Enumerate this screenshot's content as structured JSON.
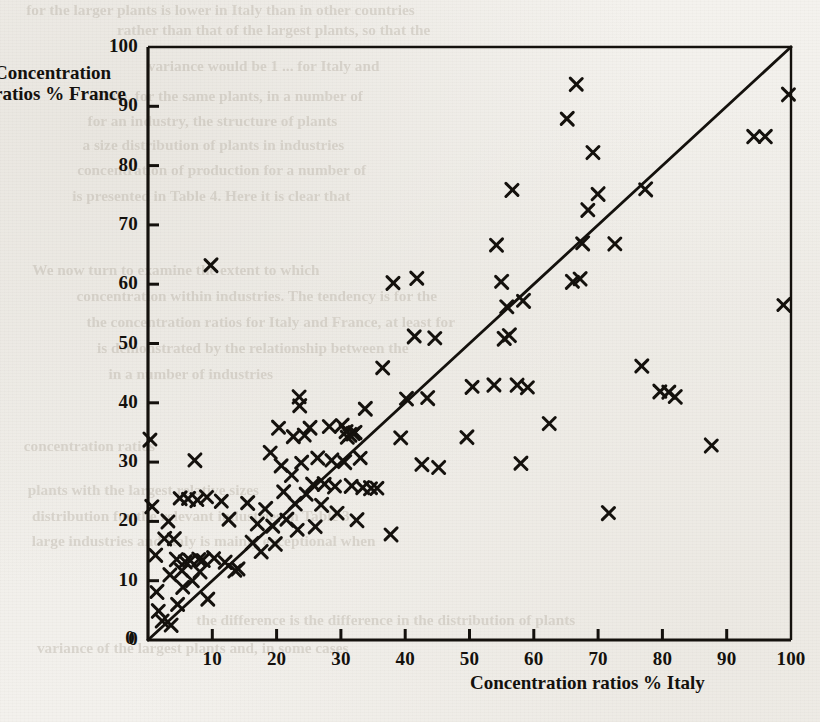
{
  "figure": {
    "kind": "scatter-plot",
    "page_background": "#f2f0ec",
    "ink_color": "#14110d"
  },
  "axes": {
    "y_title_line1": "Concentration",
    "y_title_line2": "ratios % France",
    "x_title": "Concentration ratios % Italy",
    "y_ticks": [
      "0",
      "10",
      "20",
      "30",
      "40",
      "50",
      "60",
      "70",
      "80",
      "90",
      "100"
    ],
    "x_ticks": [
      "0",
      "10",
      "20",
      "30",
      "40",
      "50",
      "60",
      "70",
      "80",
      "90",
      "100"
    ]
  },
  "ghost_text": [
    {
      "t": "for the larger plants is lower in Italy than in other countries",
      "x": 30,
      "y": 2,
      "size": 15
    },
    {
      "t": "rather than that of the largest plants, so that the",
      "x": 120,
      "y": 22,
      "size": 15
    },
    {
      "t": "variance would be 1 ... for Italy and",
      "x": 150,
      "y": 58,
      "size": 15
    },
    {
      "t": "while, for the same plants, in a number of",
      "x": 95,
      "y": 88,
      "size": 15
    },
    {
      "t": "for an industry, the structure of plants",
      "x": 90,
      "y": 113,
      "size": 15
    },
    {
      "t": "a size distribution of plants in industries",
      "x": 85,
      "y": 137,
      "size": 15
    },
    {
      "t": "concentration of production for a number of",
      "x": 80,
      "y": 162,
      "size": 15
    },
    {
      "t": "is presented in Table 4. Here it is clear that",
      "x": 75,
      "y": 188,
      "size": 15
    },
    {
      "t": "We now turn to examine the extent to which",
      "x": 35,
      "y": 262,
      "size": 15
    },
    {
      "t": "concentration within industries. The tendency is for the",
      "x": 80,
      "y": 288,
      "size": 15
    },
    {
      "t": "the concentration ratios for Italy and France, at least for",
      "x": 90,
      "y": 314,
      "size": 15
    },
    {
      "t": "is demonstrated by the relationship between the",
      "x": 100,
      "y": 340,
      "size": 15
    },
    {
      "t": "in a number of industries",
      "x": 110,
      "y": 366,
      "size": 15
    },
    {
      "t": "concentration ratios",
      "x": 25,
      "y": 438,
      "size": 15
    },
    {
      "t": "plants with the largest relative sizes",
      "x": 30,
      "y": 482,
      "size": 15
    },
    {
      "t": "distribution for the relevant industries in Table 3",
      "x": 35,
      "y": 508,
      "size": 15
    },
    {
      "t": "large industries and Italy is mainly exceptional when",
      "x": 35,
      "y": 533,
      "size": 15
    },
    {
      "t": "the difference is the difference in the distribution of plants",
      "x": 200,
      "y": 612,
      "size": 15
    },
    {
      "t": "variance of the largest plants and, in some cases",
      "x": 40,
      "y": 640,
      "size": 15
    }
  ],
  "chart_data": {
    "type": "scatter",
    "title": "",
    "xlabel": "Concentration ratios % Italy",
    "ylabel": "Concentration ratios % France",
    "xlim": [
      0,
      100
    ],
    "ylim": [
      0,
      100
    ],
    "grid": false,
    "legend": false,
    "marker": "x",
    "reference_line": {
      "kind": "identity",
      "from": [
        0,
        0
      ],
      "to": [
        100,
        100
      ],
      "label": "45-degree line"
    },
    "series": [
      {
        "name": "Industries",
        "points": [
          [
            0.3,
            33.8
          ],
          [
            0.6,
            22.5
          ],
          [
            1.2,
            14.3
          ],
          [
            1.4,
            8.1
          ],
          [
            1.6,
            4.9
          ],
          [
            2.2,
            3.2
          ],
          [
            2.6,
            17.1
          ],
          [
            3.1,
            20.0
          ],
          [
            3.4,
            11.0
          ],
          [
            3.6,
            2.5
          ],
          [
            4.1,
            17.0
          ],
          [
            4.4,
            13.6
          ],
          [
            4.6,
            6.0
          ],
          [
            5.0,
            23.9
          ],
          [
            5.2,
            11.7
          ],
          [
            5.4,
            8.9
          ],
          [
            5.8,
            13.2
          ],
          [
            6.3,
            23.8
          ],
          [
            6.5,
            13.4
          ],
          [
            6.9,
            10.0
          ],
          [
            7.3,
            30.3
          ],
          [
            7.6,
            23.6
          ],
          [
            7.9,
            13.6
          ],
          [
            8.1,
            11.5
          ],
          [
            8.6,
            13.5
          ],
          [
            9.1,
            24.1
          ],
          [
            9.3,
            6.9
          ],
          [
            9.8,
            63.2
          ],
          [
            10.2,
            13.8
          ],
          [
            11.4,
            23.4
          ],
          [
            12.0,
            13.1
          ],
          [
            12.6,
            20.3
          ],
          [
            13.5,
            11.7
          ],
          [
            14.0,
            12.0
          ],
          [
            15.5,
            23.1
          ],
          [
            16.2,
            16.4
          ],
          [
            17.0,
            19.6
          ],
          [
            17.6,
            14.9
          ],
          [
            18.3,
            22.1
          ],
          [
            19.0,
            31.6
          ],
          [
            19.4,
            19.2
          ],
          [
            19.8,
            16.2
          ],
          [
            20.3,
            35.8
          ],
          [
            20.7,
            29.4
          ],
          [
            21.1,
            25.0
          ],
          [
            21.6,
            20.3
          ],
          [
            22.3,
            27.8
          ],
          [
            22.6,
            34.3
          ],
          [
            22.9,
            23.0
          ],
          [
            23.2,
            18.6
          ],
          [
            23.5,
            41.0
          ],
          [
            23.6,
            39.5
          ],
          [
            23.9,
            29.9
          ],
          [
            24.3,
            34.5
          ],
          [
            24.6,
            24.6
          ],
          [
            25.2,
            35.8
          ],
          [
            25.6,
            26.2
          ],
          [
            26.0,
            19.1
          ],
          [
            26.4,
            30.7
          ],
          [
            27.0,
            22.8
          ],
          [
            27.4,
            26.3
          ],
          [
            28.2,
            36.0
          ],
          [
            28.6,
            30.3
          ],
          [
            29.0,
            25.9
          ],
          [
            29.4,
            21.4
          ],
          [
            30.2,
            36.2
          ],
          [
            30.6,
            30.0
          ],
          [
            30.8,
            35.2
          ],
          [
            31.0,
            34.2
          ],
          [
            31.4,
            34.6
          ],
          [
            31.6,
            26.0
          ],
          [
            31.9,
            34.8
          ],
          [
            32.2,
            35.0
          ],
          [
            32.5,
            20.2
          ],
          [
            33.0,
            30.7
          ],
          [
            33.4,
            25.7
          ],
          [
            33.8,
            39.0
          ],
          [
            34.6,
            25.6
          ],
          [
            35.6,
            25.6
          ],
          [
            36.5,
            45.9
          ],
          [
            37.8,
            17.8
          ],
          [
            38.1,
            60.2
          ],
          [
            39.3,
            34.1
          ],
          [
            40.2,
            40.7
          ],
          [
            41.4,
            51.2
          ],
          [
            41.8,
            61.0
          ],
          [
            42.6,
            29.6
          ],
          [
            43.5,
            40.8
          ],
          [
            44.6,
            50.9
          ],
          [
            45.2,
            29.1
          ],
          [
            49.6,
            34.2
          ],
          [
            50.4,
            42.7
          ],
          [
            53.8,
            43.0
          ],
          [
            54.2,
            66.6
          ],
          [
            55.0,
            60.4
          ],
          [
            55.4,
            50.8
          ],
          [
            55.8,
            56.2
          ],
          [
            56.2,
            51.4
          ],
          [
            56.6,
            75.9
          ],
          [
            57.4,
            43.0
          ],
          [
            58.0,
            29.8
          ],
          [
            58.4,
            57.2
          ],
          [
            59.0,
            42.6
          ],
          [
            62.4,
            36.5
          ],
          [
            65.2,
            87.9
          ],
          [
            66.0,
            60.4
          ],
          [
            66.6,
            93.7
          ],
          [
            67.2,
            60.9
          ],
          [
            67.6,
            66.9
          ],
          [
            68.4,
            72.5
          ],
          [
            69.2,
            82.2
          ],
          [
            70.0,
            75.2
          ],
          [
            71.6,
            21.4
          ],
          [
            72.6,
            66.8
          ],
          [
            76.8,
            46.2
          ],
          [
            77.4,
            76.0
          ],
          [
            79.6,
            41.9
          ],
          [
            81.0,
            41.8
          ],
          [
            82.0,
            41.0
          ],
          [
            87.6,
            32.8
          ],
          [
            94.2,
            84.9
          ],
          [
            96.0,
            84.9
          ],
          [
            98.9,
            56.5
          ],
          [
            99.6,
            92.0
          ]
        ]
      }
    ]
  }
}
